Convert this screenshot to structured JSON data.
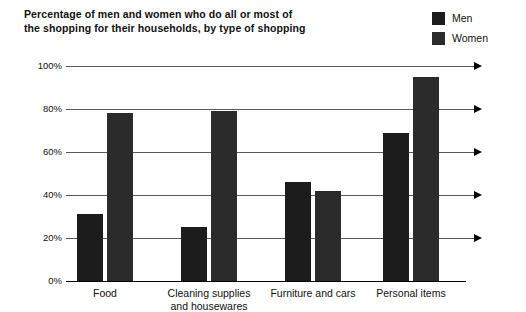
{
  "chart_data": {
    "type": "bar",
    "title": "Percentage of men and women who do all or most of the shopping for their households, by type of shopping",
    "title_lines": [
      "Percentage of men and women who do all or most of",
      "the shopping for their households, by type of shopping"
    ],
    "xlabel": "",
    "ylabel": "",
    "ylim": [
      0,
      100
    ],
    "yticks": [
      0,
      20,
      40,
      60,
      80,
      100
    ],
    "ytick_labels": [
      "0%",
      "20%",
      "40%",
      "60%",
      "80%",
      "100%"
    ],
    "grid": true,
    "grid_arrows": true,
    "legend_position": "top-right",
    "categories": [
      "Food",
      "Cleaning supplies and housewares",
      "Furniture and cars",
      "Personal items"
    ],
    "category_label_lines": [
      [
        "Food"
      ],
      [
        "Cleaning supplies",
        "and housewares"
      ],
      [
        "Furniture and cars"
      ],
      [
        "Personal items"
      ]
    ],
    "series": [
      {
        "name": "Men",
        "color": "#1c1c1c",
        "values": [
          31,
          25,
          46,
          69
        ]
      },
      {
        "name": "Women",
        "color": "#2b2b2b",
        "values": [
          78,
          79,
          42,
          95
        ]
      }
    ],
    "value_unit": "%"
  },
  "legend": {
    "items": [
      {
        "label": "Men",
        "color": "#1c1c1c"
      },
      {
        "label": "Women",
        "color": "#2b2b2b"
      }
    ]
  },
  "colors": {
    "background": "#ffffff",
    "text": "#111111",
    "gridline": "#58585a",
    "axis": "#000000"
  }
}
